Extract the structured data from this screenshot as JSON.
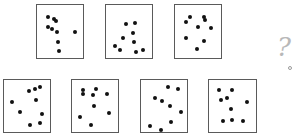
{
  "puzzle": {
    "question_mark": "?",
    "panels": [
      {
        "id": 1,
        "row": "top",
        "box": {
          "x": 36,
          "y": 4,
          "w": 48,
          "h": 55
        },
        "dots": [
          [
            23,
            22
          ],
          [
            36,
            27
          ],
          [
            42,
            31
          ],
          [
            23,
            42
          ],
          [
            32,
            46
          ],
          [
            44,
            51
          ],
          [
            46,
            70
          ],
          [
            83,
            51
          ],
          [
            48,
            86
          ]
        ]
      },
      {
        "id": 2,
        "row": "top",
        "box": {
          "x": 105,
          "y": 4,
          "w": 48,
          "h": 55
        },
        "dots": [
          [
            44,
            36
          ],
          [
            62,
            34
          ],
          [
            58,
            52
          ],
          [
            37,
            63
          ],
          [
            60,
            69
          ],
          [
            19,
            78
          ],
          [
            31,
            84
          ],
          [
            65,
            88
          ],
          [
            80,
            84
          ]
        ]
      },
      {
        "id": 3,
        "row": "top",
        "box": {
          "x": 174,
          "y": 4,
          "w": 48,
          "h": 55
        },
        "dots": [
          [
            33,
            23
          ],
          [
            64,
            22
          ],
          [
            65,
            29
          ],
          [
            24,
            32
          ],
          [
            50,
            41
          ],
          [
            78,
            43
          ],
          [
            24,
            63
          ],
          [
            62,
            67
          ],
          [
            47,
            83
          ]
        ]
      },
      {
        "id": 4,
        "row": "bottom",
        "box": {
          "x": 3,
          "y": 79,
          "w": 48,
          "h": 54
        },
        "dots": [
          [
            55,
            21
          ],
          [
            67,
            18
          ],
          [
            79,
            14
          ],
          [
            70,
            39
          ],
          [
            18,
            43
          ],
          [
            35,
            62
          ],
          [
            82,
            66
          ],
          [
            56,
            86
          ],
          [
            79,
            82
          ]
        ]
      },
      {
        "id": 5,
        "row": "bottom",
        "box": {
          "x": 71,
          "y": 79,
          "w": 48,
          "h": 54
        },
        "dots": [
          [
            24,
            20
          ],
          [
            24,
            26
          ],
          [
            52,
            18
          ],
          [
            46,
            28
          ],
          [
            76,
            26
          ],
          [
            48,
            50
          ],
          [
            80,
            64
          ],
          [
            17,
            72
          ],
          [
            41,
            86
          ]
        ]
      },
      {
        "id": 6,
        "row": "bottom",
        "box": {
          "x": 140,
          "y": 79,
          "w": 48,
          "h": 54
        },
        "dots": [
          [
            58,
            14
          ],
          [
            80,
            18
          ],
          [
            30,
            34
          ],
          [
            46,
            40
          ],
          [
            62,
            50
          ],
          [
            86,
            62
          ],
          [
            66,
            80
          ],
          [
            20,
            89
          ],
          [
            44,
            96
          ]
        ]
      },
      {
        "id": 7,
        "row": "bottom",
        "box": {
          "x": 208,
          "y": 79,
          "w": 49,
          "h": 54
        },
        "dots": [
          [
            21,
            20
          ],
          [
            49,
            20
          ],
          [
            26,
            38
          ],
          [
            38,
            35
          ],
          [
            81,
            43
          ],
          [
            46,
            56
          ],
          [
            29,
            78
          ],
          [
            48,
            76
          ],
          [
            72,
            78
          ]
        ]
      }
    ],
    "answer_hint": {
      "x": 277,
      "y": 34,
      "dot_x": 288,
      "dot_y": 66
    }
  }
}
